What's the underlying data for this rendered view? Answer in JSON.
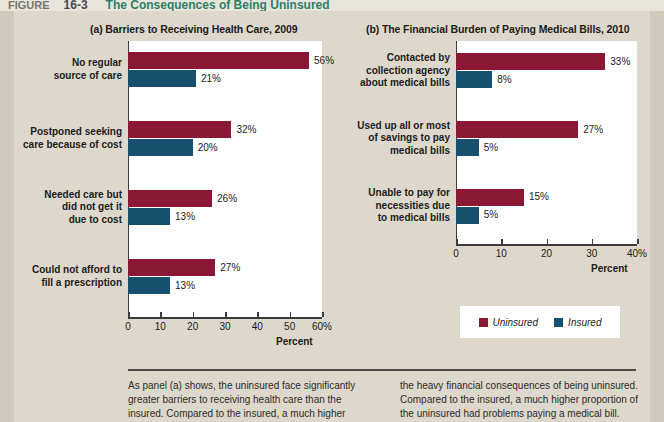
{
  "figure_header": {
    "label": "FIGURE",
    "number": "16-3",
    "title": "The Consequences of Being Uninsured"
  },
  "panels": {
    "a": {
      "title": "(a) Barriers to Receiving Health Care, 2009",
      "axis_title": "Percent",
      "ticks": [
        "0",
        "10",
        "20",
        "30",
        "40",
        "50",
        "60%"
      ],
      "tick_values": [
        0,
        10,
        20,
        30,
        40,
        50,
        60
      ]
    },
    "b": {
      "title": "(b) The Financial Burden of Paying Medical Bills, 2010",
      "axis_title": "Percent",
      "ticks": [
        "0",
        "10",
        "20",
        "30",
        "40%"
      ],
      "tick_values": [
        0,
        10,
        20,
        30,
        40
      ]
    }
  },
  "legend": {
    "items": [
      {
        "label": "Uninsured",
        "color": "#8a1834"
      },
      {
        "label": "Insured",
        "color": "#17506f"
      }
    ]
  },
  "caption": {
    "left": "As panel (a) shows, the uninsured face significantly greater barriers to receiving health care than the insured. Compared to the insured, a much higher",
    "right": "the heavy financial consequences of being uninsured. Compared to the insured, a much higher proportion of the uninsured had problems paying a medical bill."
  },
  "chart_data": [
    {
      "type": "bar",
      "title": "(a) Barriers to Receiving Health Care, 2009",
      "orientation": "horizontal",
      "xlabel": "Percent",
      "ylabel": "",
      "xlim": [
        0,
        60
      ],
      "grid": false,
      "legend_position": "bottom-right (shared)",
      "categories": [
        "No regular\nsource of care",
        "Postponed seeking\ncare because of cost",
        "Needed care but\ndid not get it\ndue to cost",
        "Could not afford to\nfill a prescription"
      ],
      "series": [
        {
          "name": "Uninsured",
          "color": "#8a1834",
          "values": [
            56,
            32,
            26,
            27
          ],
          "labels": [
            "56%",
            "32%",
            "26%",
            "27%"
          ]
        },
        {
          "name": "Insured",
          "color": "#17506f",
          "values": [
            21,
            20,
            13,
            13
          ],
          "labels": [
            "21%",
            "20%",
            "13%",
            "13%"
          ]
        }
      ]
    },
    {
      "type": "bar",
      "title": "(b) The Financial Burden of Paying Medical Bills, 2010",
      "orientation": "horizontal",
      "xlabel": "Percent",
      "ylabel": "",
      "xlim": [
        0,
        40
      ],
      "grid": false,
      "legend_position": "below-plot",
      "categories": [
        "Contacted by\ncollection agency\nabout medical bills",
        "Used up all or most\nof savings to pay\nmedical bills",
        "Unable to pay for\nnecessities due\nto medical bills"
      ],
      "series": [
        {
          "name": "Uninsured",
          "color": "#8a1834",
          "values": [
            33,
            27,
            15
          ],
          "labels": [
            "33%",
            "27%",
            "15%"
          ]
        },
        {
          "name": "Insured",
          "color": "#17506f",
          "values": [
            8,
            5,
            5
          ],
          "labels": [
            "8%",
            "5%",
            "5%"
          ]
        }
      ]
    }
  ]
}
